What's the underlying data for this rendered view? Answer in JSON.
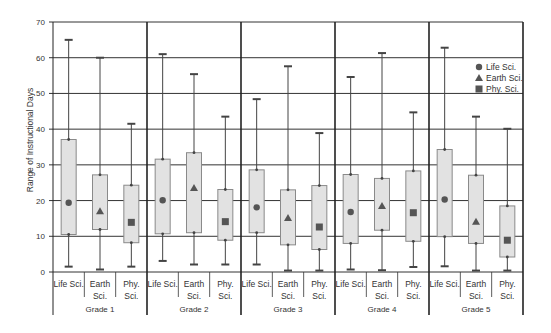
{
  "chart_data": {
    "type": "boxplot",
    "title": "",
    "xlabel": "",
    "ylabel": "Range of Instructional Days",
    "ylim": [
      0,
      70
    ],
    "yticks": [
      0,
      10,
      20,
      30,
      40,
      50,
      60,
      70
    ],
    "grid": true,
    "legend_position": "top-right inside",
    "legend": [
      {
        "name": "Life Sci.",
        "marker": "circle"
      },
      {
        "name": "Earth Sci.",
        "marker": "triangle"
      },
      {
        "name": "Phy. Sci.",
        "marker": "square"
      }
    ],
    "groups": [
      {
        "label": "Grade 1",
        "items": [
          {
            "subject": "Life Sci.",
            "label_lines": [
              "Life Sci."
            ],
            "min": 1.5,
            "q1": 10.5,
            "mean": 19.4,
            "q3": 37.1,
            "max": 65.0,
            "marker": "circle"
          },
          {
            "subject": "Earth Sci.",
            "label_lines": [
              "Earth",
              "Sci."
            ],
            "min": 0.7,
            "q1": 11.9,
            "mean": 17.0,
            "q3": 27.2,
            "max": 60.0,
            "marker": "triangle"
          },
          {
            "subject": "Phy. Sci.",
            "label_lines": [
              "Phy.",
              "Sci."
            ],
            "min": 1.5,
            "q1": 8.2,
            "mean": 13.9,
            "q3": 24.3,
            "max": 41.5,
            "marker": "square"
          }
        ]
      },
      {
        "label": "Grade 2",
        "items": [
          {
            "subject": "Life Sci.",
            "label_lines": [
              "Life Sci."
            ],
            "min": 3.1,
            "q1": 10.7,
            "mean": 20.1,
            "q3": 31.6,
            "max": 61.0,
            "marker": "circle"
          },
          {
            "subject": "Earth Sci.",
            "label_lines": [
              "Earth",
              "Sci."
            ],
            "min": 2.1,
            "q1": 11.0,
            "mean": 23.5,
            "q3": 33.4,
            "max": 55.4,
            "marker": "triangle"
          },
          {
            "subject": "Phy. Sci.",
            "label_lines": [
              "Phy.",
              "Sci."
            ],
            "min": 2.1,
            "q1": 8.9,
            "mean": 14.1,
            "q3": 23.1,
            "max": 43.5,
            "marker": "square"
          }
        ]
      },
      {
        "label": "Grade 3",
        "items": [
          {
            "subject": "Life Sci.",
            "label_lines": [
              "Life Sci."
            ],
            "min": 2.1,
            "q1": 11.0,
            "mean": 18.1,
            "q3": 28.6,
            "max": 48.4,
            "marker": "circle"
          },
          {
            "subject": "Earth Sci.",
            "label_lines": [
              "Earth",
              "Sci."
            ],
            "min": 0.4,
            "q1": 7.6,
            "mean": 15.1,
            "q3": 23.0,
            "max": 57.6,
            "marker": "triangle"
          },
          {
            "subject": "Phy. Sci.",
            "label_lines": [
              "Phy.",
              "Sci."
            ],
            "min": 0.4,
            "q1": 6.3,
            "mean": 12.6,
            "q3": 24.2,
            "max": 38.9,
            "marker": "square"
          }
        ]
      },
      {
        "label": "Grade 4",
        "items": [
          {
            "subject": "Life Sci.",
            "label_lines": [
              "Life Sci."
            ],
            "min": 0.7,
            "q1": 8.0,
            "mean": 16.8,
            "q3": 27.3,
            "max": 54.6,
            "marker": "circle"
          },
          {
            "subject": "Earth Sci.",
            "label_lines": [
              "Earth",
              "Sci."
            ],
            "min": 0.5,
            "q1": 11.7,
            "mean": 18.5,
            "q3": 26.2,
            "max": 61.3,
            "marker": "triangle"
          },
          {
            "subject": "Phy. Sci.",
            "label_lines": [
              "Phy.",
              "Sci."
            ],
            "min": 1.4,
            "q1": 8.6,
            "mean": 16.6,
            "q3": 28.3,
            "max": 44.7,
            "marker": "square"
          }
        ]
      },
      {
        "label": "Grade 5",
        "items": [
          {
            "subject": "Life Sci.",
            "label_lines": [
              "Life Sci."
            ],
            "min": 1.6,
            "q1": 9.9,
            "mean": 20.3,
            "q3": 34.3,
            "max": 62.8,
            "marker": "circle"
          },
          {
            "subject": "Earth Sci.",
            "label_lines": [
              "Earth",
              "Sci."
            ],
            "min": 0.4,
            "q1": 8.0,
            "mean": 14.1,
            "q3": 27.1,
            "max": 43.5,
            "marker": "triangle"
          },
          {
            "subject": "Phy. Sci.",
            "label_lines": [
              "Phy.",
              "Sci."
            ],
            "min": 0.4,
            "q1": 4.2,
            "mean": 8.9,
            "q3": 18.5,
            "max": 40.1,
            "marker": "square"
          }
        ]
      }
    ]
  },
  "colors": {
    "box_fill": "#e2e2e2",
    "box_stroke": "#8a8a8a",
    "whisker": "#444444",
    "marker": "#555555",
    "grid": "#333333",
    "group_divider": "#222222",
    "text": "#333333"
  }
}
